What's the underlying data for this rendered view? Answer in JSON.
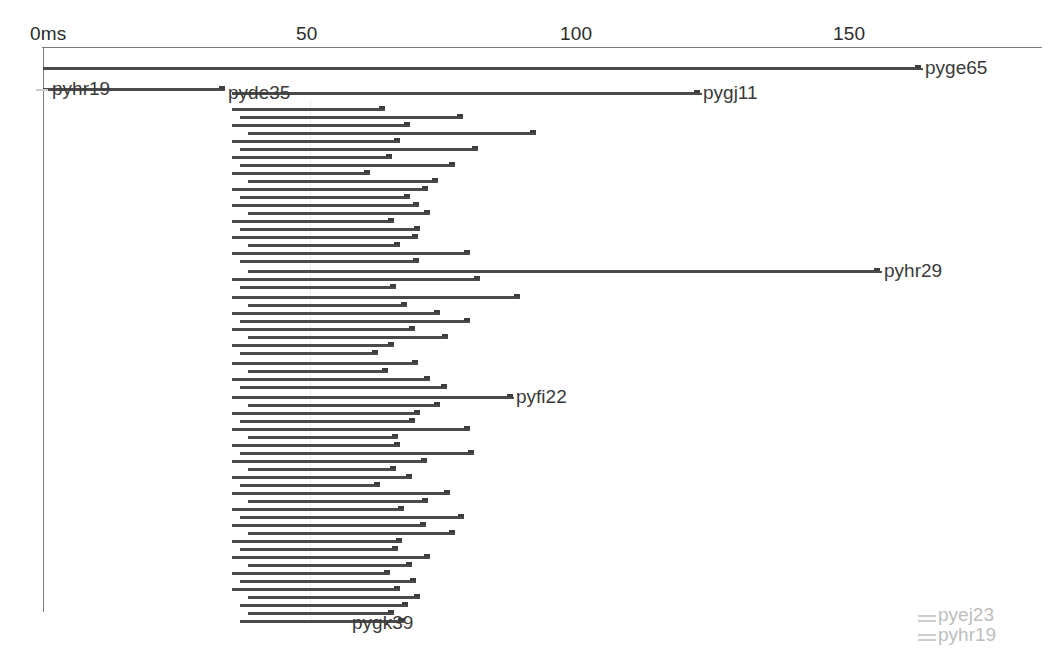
{
  "chart_data": {
    "type": "bar",
    "orientation": "horizontal",
    "title": "",
    "xlabel": "",
    "ylabel": "",
    "xlim": [
      0,
      184
    ],
    "grid": true,
    "legend": null,
    "axis": {
      "unit": "ms",
      "tick_labels": [
        "0ms",
        "50",
        "100",
        "150"
      ],
      "tick_values": [
        0,
        50,
        100,
        150
      ],
      "tick_px": [
        42,
        310,
        582,
        855
      ]
    },
    "categories": [
      "pyge65",
      "pyhr19",
      "pyde35",
      "pygj11",
      "pyhr29",
      "pyfi22",
      "pygk39",
      "pyej23",
      "pyhr19b"
    ],
    "labeled_spans": [
      {
        "name": "pyge65",
        "start_ms": 0.2,
        "end_ms": 161.5,
        "row": 0,
        "label_side": "right"
      },
      {
        "name": "pyhr19",
        "start_ms": 0.2,
        "end_ms": 33.0,
        "row": 1,
        "label_side": "inline"
      },
      {
        "name": "pyde35",
        "start_ms": 35.0,
        "end_ms": 62.0,
        "row": 1,
        "label_side": "inline"
      },
      {
        "name": "pygj11",
        "start_ms": 35.0,
        "end_ms": 121.0,
        "row": 2,
        "label_side": "right"
      },
      {
        "name": "pyhr29",
        "start_ms": 38.5,
        "end_ms": 154.5,
        "row": 22,
        "label_side": "right"
      },
      {
        "name": "pyfi22",
        "start_ms": 38.0,
        "end_ms": 86.5,
        "row": 38,
        "label_side": "right"
      },
      {
        "name": "pygk39",
        "start_ms": 38.0,
        "end_ms": 62.5,
        "row": 64,
        "label_side": "right"
      },
      {
        "name": "pyej23",
        "start_ms": 0,
        "end_ms": 0,
        "row": 65,
        "label_side": "faint"
      },
      {
        "name": "pyhr19",
        "start_ms": 0,
        "end_ms": 0,
        "row": 66,
        "label_side": "faint"
      }
    ],
    "rows": [
      {
        "y": 67,
        "start": 43,
        "end": 921
      },
      {
        "y": 88,
        "start": 43,
        "end": 225
      },
      {
        "y": 92,
        "start": 232,
        "end": 700
      },
      {
        "y": 108,
        "start": 232,
        "end": 385
      },
      {
        "y": 116,
        "start": 240,
        "end": 463
      },
      {
        "y": 124,
        "start": 232,
        "end": 410
      },
      {
        "y": 132,
        "start": 248,
        "end": 536
      },
      {
        "y": 140,
        "start": 232,
        "end": 400
      },
      {
        "y": 148,
        "start": 240,
        "end": 478
      },
      {
        "y": 156,
        "start": 232,
        "end": 392
      },
      {
        "y": 164,
        "start": 240,
        "end": 455
      },
      {
        "y": 172,
        "start": 232,
        "end": 370
      },
      {
        "y": 180,
        "start": 248,
        "end": 438
      },
      {
        "y": 188,
        "start": 232,
        "end": 428
      },
      {
        "y": 196,
        "start": 240,
        "end": 410
      },
      {
        "y": 204,
        "start": 232,
        "end": 419
      },
      {
        "y": 212,
        "start": 248,
        "end": 430
      },
      {
        "y": 220,
        "start": 232,
        "end": 394
      },
      {
        "y": 228,
        "start": 240,
        "end": 420
      },
      {
        "y": 236,
        "start": 232,
        "end": 418
      },
      {
        "y": 244,
        "start": 248,
        "end": 400
      },
      {
        "y": 252,
        "start": 232,
        "end": 470
      },
      {
        "y": 260,
        "start": 240,
        "end": 419
      },
      {
        "y": 270,
        "start": 248,
        "end": 880
      },
      {
        "y": 278,
        "start": 232,
        "end": 480
      },
      {
        "y": 286,
        "start": 240,
        "end": 396
      },
      {
        "y": 296,
        "start": 232,
        "end": 520
      },
      {
        "y": 304,
        "start": 248,
        "end": 407
      },
      {
        "y": 312,
        "start": 232,
        "end": 440
      },
      {
        "y": 320,
        "start": 240,
        "end": 470
      },
      {
        "y": 328,
        "start": 232,
        "end": 415
      },
      {
        "y": 336,
        "start": 248,
        "end": 448
      },
      {
        "y": 344,
        "start": 232,
        "end": 394
      },
      {
        "y": 352,
        "start": 240,
        "end": 378
      },
      {
        "y": 362,
        "start": 232,
        "end": 418
      },
      {
        "y": 370,
        "start": 248,
        "end": 388
      },
      {
        "y": 378,
        "start": 232,
        "end": 430
      },
      {
        "y": 386,
        "start": 240,
        "end": 447
      },
      {
        "y": 396,
        "start": 232,
        "end": 513
      },
      {
        "y": 404,
        "start": 248,
        "end": 440
      },
      {
        "y": 412,
        "start": 232,
        "end": 420
      },
      {
        "y": 420,
        "start": 240,
        "end": 415
      },
      {
        "y": 428,
        "start": 232,
        "end": 470
      },
      {
        "y": 436,
        "start": 248,
        "end": 398
      },
      {
        "y": 444,
        "start": 232,
        "end": 400
      },
      {
        "y": 452,
        "start": 240,
        "end": 474
      },
      {
        "y": 460,
        "start": 232,
        "end": 427
      },
      {
        "y": 468,
        "start": 248,
        "end": 396
      },
      {
        "y": 476,
        "start": 232,
        "end": 412
      },
      {
        "y": 484,
        "start": 240,
        "end": 380
      },
      {
        "y": 492,
        "start": 232,
        "end": 450
      },
      {
        "y": 500,
        "start": 248,
        "end": 428
      },
      {
        "y": 508,
        "start": 232,
        "end": 404
      },
      {
        "y": 516,
        "start": 240,
        "end": 464
      },
      {
        "y": 524,
        "start": 232,
        "end": 426
      },
      {
        "y": 532,
        "start": 248,
        "end": 455
      },
      {
        "y": 540,
        "start": 232,
        "end": 402
      },
      {
        "y": 548,
        "start": 240,
        "end": 398
      },
      {
        "y": 556,
        "start": 232,
        "end": 430
      },
      {
        "y": 564,
        "start": 248,
        "end": 412
      },
      {
        "y": 572,
        "start": 232,
        "end": 390
      },
      {
        "y": 580,
        "start": 240,
        "end": 416
      },
      {
        "y": 588,
        "start": 232,
        "end": 400
      },
      {
        "y": 596,
        "start": 248,
        "end": 420
      },
      {
        "y": 604,
        "start": 240,
        "end": 408
      },
      {
        "y": 612,
        "start": 248,
        "end": 394
      },
      {
        "y": 620,
        "start": 240,
        "end": 404
      }
    ]
  },
  "axis": {
    "t0": {
      "label": "0ms"
    },
    "t1": {
      "label": "50"
    },
    "t2": {
      "label": "100"
    },
    "t3": {
      "label": "150"
    }
  },
  "labels": {
    "pyge65": "pyge65",
    "pyhr19": "pyhr19",
    "pyde35": "pyde35",
    "pygj11": "pygj11",
    "pyhr29": "pyhr29",
    "pyfi22": "pyfi22",
    "pygk39": "pygk39",
    "pyej23": "pyej23",
    "pyhr19_faint": "pyhr19"
  },
  "colors": {
    "bar": "#4a4a4a",
    "axis": "#7a7a7a",
    "text": "#3a3a3a",
    "faint_text": "#bdbdbd",
    "grid": "#ededed",
    "background": "#ffffff"
  }
}
